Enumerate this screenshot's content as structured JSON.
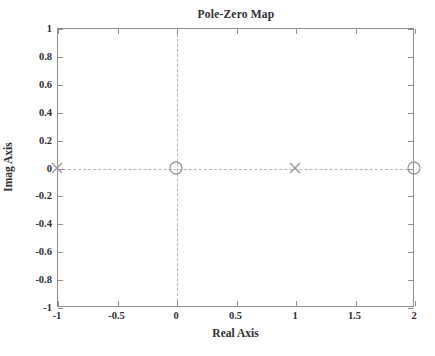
{
  "chart_data": {
    "type": "scatter",
    "title": "Pole-Zero Map",
    "xlabel": "Real Axis",
    "ylabel": "Imag Axis",
    "xlim": [
      -1,
      2
    ],
    "ylim": [
      -1,
      1
    ],
    "xticks": [
      -1,
      -0.5,
      0,
      0.5,
      1,
      1.5,
      2
    ],
    "xtick_labels": [
      "-1",
      "-0.5",
      "0",
      "0.5",
      "1",
      "1.5",
      "2"
    ],
    "yticks": [
      1,
      0.8,
      0.6,
      0.4,
      0.2,
      0,
      -0.2,
      -0.4,
      -0.6,
      -0.8,
      -1
    ],
    "ytick_labels": [
      "1",
      "0.8",
      "0.6",
      "0.4",
      "0.2",
      "0",
      "-0.2",
      "-0.4",
      "-0.6",
      "-0.8",
      "-1"
    ],
    "grid": false,
    "gridlines": [
      {
        "axis": "x",
        "value": 0,
        "style": "dashed"
      },
      {
        "axis": "y",
        "value": 0,
        "style": "dashed"
      }
    ],
    "legend": null,
    "series": [
      {
        "name": "poles",
        "marker": "x",
        "color": "#9a9a9a",
        "points": [
          {
            "x": -1,
            "y": 0,
            "label": "pole at -1"
          },
          {
            "x": 1,
            "y": 0,
            "label": "pole at 1"
          }
        ]
      },
      {
        "name": "zeros",
        "marker": "o",
        "color": "#9a9a9a",
        "points": [
          {
            "x": 0,
            "y": 0,
            "label": "zero at 0"
          },
          {
            "x": 2,
            "y": 0,
            "label": "zero at 2"
          }
        ]
      }
    ]
  },
  "style": {
    "axis_color": "#8e8e8e",
    "grid_color": "#b6b6b6",
    "marker_color": "#9a9a9a",
    "text_color": "#2e2e2e",
    "background": "#ffffff"
  }
}
